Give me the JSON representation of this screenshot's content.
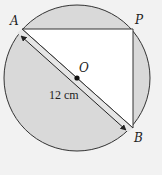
{
  "diagram": {
    "type": "geometry",
    "labels": {
      "A": "A",
      "P": "P",
      "O": "O",
      "B": "B"
    },
    "measurement": "12 cm",
    "colors": {
      "background": "#f2f2f2",
      "shaded": "#d9d9d9",
      "triangle": "#ffffff",
      "stroke": "#333333"
    }
  }
}
